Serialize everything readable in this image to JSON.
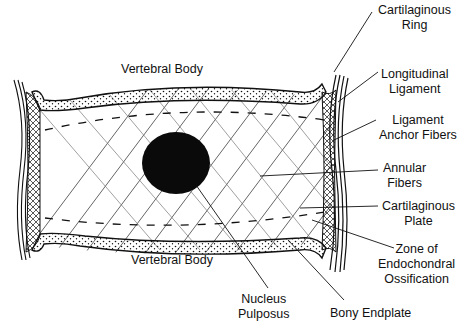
{
  "diagram": {
    "labels": {
      "vertebral_body_top": "Vertebral Body",
      "vertebral_body_bottom": "Vertebral Body",
      "cartilaginous_ring": [
        "Cartilaginous",
        "Ring"
      ],
      "longitudinal_ligament": [
        "Longitudinal",
        "Ligament"
      ],
      "ligament_anchor_fibers": [
        "Ligament",
        "Anchor Fibers"
      ],
      "annular_fibers": [
        "Annular",
        "Fibers"
      ],
      "cartilaginous_plate": [
        "Cartilaginous",
        "Plate"
      ],
      "zone_endochondral": [
        "Zone of",
        "Endochondral",
        "Ossification"
      ],
      "nucleus_pulposus": [
        "Nucleus",
        "Pulposus"
      ],
      "bony_endplate": "Bony Endplate"
    },
    "colors": {
      "ink": "#111111",
      "background": "#ffffff"
    }
  }
}
